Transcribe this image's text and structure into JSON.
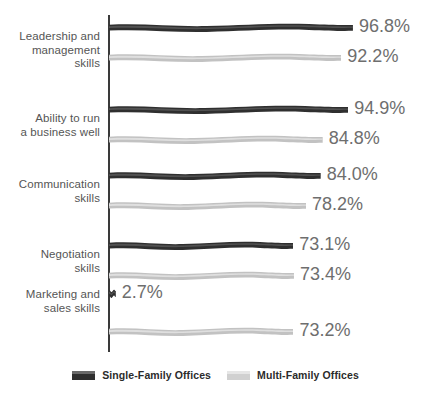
{
  "chart_data": {
    "type": "bar",
    "orientation": "horizontal",
    "title": "",
    "xlabel": "",
    "ylabel": "",
    "xlim": [
      0,
      100
    ],
    "grid": false,
    "legend_position": "bottom-center",
    "value_suffix": "%",
    "categories": [
      "Leadership and\nmanagement\nskills",
      "Ability to run\na business well",
      "Communication\nskills",
      "Negotiation\nskills",
      "Marketing and\nsales skills"
    ],
    "series": [
      {
        "name": "Single-Family Offices",
        "color": "#2f2f2f",
        "values": [
          96.8,
          94.9,
          84.0,
          73.1,
          2.7
        ],
        "labels": [
          "96.8%",
          "94.9%",
          "84.0%",
          "73.1%",
          "2.7%"
        ]
      },
      {
        "name": "Multi-Family Offices",
        "color": "#c2c2c2",
        "values": [
          92.2,
          84.8,
          78.2,
          73.4,
          73.2
        ],
        "labels": [
          "92.2%",
          "84.8%",
          "78.2%",
          "73.4%",
          "73.2%"
        ]
      }
    ]
  },
  "legend": {
    "items": [
      {
        "label": "Single-Family Offices",
        "swatch": "dark"
      },
      {
        "label": "Multi-Family Offices",
        "swatch": "light"
      }
    ]
  },
  "colors": {
    "dark_series": "#2f2f2f",
    "light_series": "#c2c2c2",
    "axis": "#3a3a3a",
    "value_text": "#6e6e6e",
    "category_text": "#555555",
    "legend_text": "#2b2b2b",
    "background": "#ffffff"
  }
}
